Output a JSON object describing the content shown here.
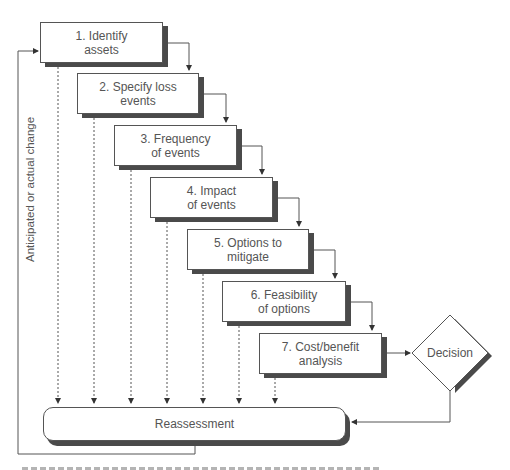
{
  "diagram": {
    "steps": [
      {
        "id": 1,
        "label": "1. Identify\nassets"
      },
      {
        "id": 2,
        "label": "2. Specify loss\nevents"
      },
      {
        "id": 3,
        "label": "3. Frequency\nof events"
      },
      {
        "id": 4,
        "label": "4. Impact\nof events"
      },
      {
        "id": 5,
        "label": "5. Options to\nmitigate"
      },
      {
        "id": 6,
        "label": "6. Feasibility\nof options"
      },
      {
        "id": 7,
        "label": "7. Cost/benefit\nanalysis"
      }
    ],
    "decision": {
      "label": "Decision"
    },
    "reassessment": {
      "label": "Reassessment"
    },
    "feedback_label": "Anticipated or actual change"
  },
  "colors": {
    "line": "#555555",
    "shadow": "#4a4a4a",
    "text": "#555555",
    "background": "#ffffff"
  }
}
